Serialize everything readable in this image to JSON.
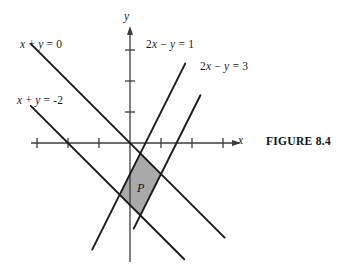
{
  "figure": {
    "caption": "FIGURE 8.4",
    "region_label": "P",
    "axis_labels": {
      "x": "x",
      "y": "y"
    }
  },
  "chart_data": {
    "type": "line",
    "title": "",
    "subtitle": "",
    "xlabel": "x",
    "ylabel": "y",
    "grid": false,
    "legend_position": "none",
    "xlim": [
      -3.2,
      3.6
    ],
    "ylim": [
      -4.0,
      3.9
    ],
    "xticks": [
      -3,
      -2,
      -1,
      1,
      2,
      3
    ],
    "yticks": [
      1,
      2,
      3
    ],
    "xtick_labels": [
      "",
      "",
      "",
      "",
      "",
      ""
    ],
    "ytick_labels": [
      "",
      "",
      ""
    ],
    "axes_style": "arrows-both-positive-ends",
    "series": [
      {
        "name": "x + y = 0",
        "equation": "x + y = 0",
        "slope": -1,
        "intercept": 0,
        "label_text_parts": [
          "x",
          " + ",
          "y",
          " = 0"
        ],
        "draw_from": [
          -3.2,
          3.2
        ],
        "draw_to": [
          3.05,
          -3.05
        ]
      },
      {
        "name": "x + y = -2",
        "equation": "x + y = -2",
        "slope": -1,
        "intercept": -2,
        "label_text_parts": [
          "x",
          " + ",
          "y",
          " = −2"
        ],
        "draw_from": [
          -3.2,
          1.2
        ],
        "draw_to": [
          1.75,
          -3.75
        ]
      },
      {
        "name": "2x - y = 1",
        "equation": "2x − y = 1",
        "slope": 2,
        "intercept": -1,
        "label_text_parts": [
          "2",
          "x",
          " − ",
          "y",
          " = 1"
        ],
        "draw_from": [
          1.78,
          2.56
        ],
        "draw_to": [
          -1.22,
          -3.44
        ]
      },
      {
        "name": "2x - y = 3",
        "equation": "2x − y = 3",
        "slope": 2,
        "intercept": -3,
        "label_text_parts": [
          "2",
          "x",
          " − ",
          "y",
          " = 3"
        ],
        "draw_from": [
          2.27,
          1.54
        ],
        "draw_to": [
          0.12,
          -2.76
        ]
      }
    ],
    "shaded_region": {
      "label": "P",
      "fill_color": "#a9a9a9",
      "description": "feasible parallelogram bounded by x+y=0, x+y=-2, 2x-y=1, 2x-y=3",
      "vertices": [
        {
          "x": 0.3333,
          "y": -0.3333
        },
        {
          "x": 1.0,
          "y": -1.0
        },
        {
          "x": 0.3333,
          "y": -2.3333
        },
        {
          "x": -0.3333,
          "y": -1.6667
        }
      ],
      "vertex_labels": [
        "(1/3, -1/3)",
        "(1, -1)",
        "(1/3, -7/3)",
        "(-1/3, -5/3)"
      ]
    },
    "annotations": [
      {
        "text": "x + y = 0",
        "x": -3.05,
        "y": 3.35
      },
      {
        "text": "x + y = -2",
        "x": -3.2,
        "y": 1.55
      },
      {
        "text": "2x - y = 1",
        "x": 0.55,
        "y": 3.35
      },
      {
        "text": "2x - y = 3",
        "x": 2.3,
        "y": 2.6
      },
      {
        "text": "P",
        "x": 0.32,
        "y": -1.35
      }
    ]
  },
  "colors": {
    "line": "#1a1a1a",
    "axis": "#3a3a3a",
    "fill": "#a9a9a9",
    "background": "#ffffff",
    "text": "#111111"
  }
}
